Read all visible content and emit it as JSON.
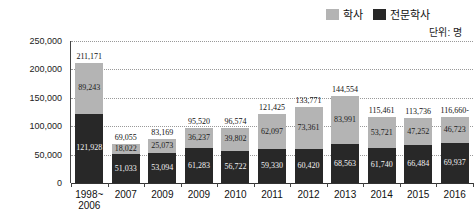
{
  "legend": {
    "items": [
      {
        "label": "학사",
        "color": "#b4b4b4"
      },
      {
        "label": "전문학사",
        "color": "#282828"
      }
    ]
  },
  "unit_label": "단위: 명",
  "chart_data": {
    "type": "bar",
    "stacked": true,
    "grid": true,
    "legend_position": "top-right",
    "ylim": [
      0,
      250000
    ],
    "yticks": [
      0,
      50000,
      100000,
      150000,
      200000,
      250000
    ],
    "ytick_labels": [
      "0",
      "50,000",
      "100,000",
      "150,000",
      "200,000",
      "250,000"
    ],
    "categories": [
      "1998~|2006",
      "2007",
      "2009",
      "2009",
      "2010",
      "2011",
      "2012",
      "2013",
      "2014",
      "2015",
      "2016"
    ],
    "series": [
      {
        "name": "전문학사",
        "color": "#282828",
        "label_color": "#f3f3f3",
        "values": [
          121928,
          51033,
          53094,
          61283,
          56722,
          59330,
          60420,
          68563,
          61740,
          66484,
          69937
        ],
        "labels": [
          "121,928",
          "51,033",
          "53,094",
          "61,283",
          "56,722",
          "59,330",
          "60,420",
          "68,563",
          "61,740",
          "66,484",
          "69,937"
        ]
      },
      {
        "name": "학사",
        "color": "#b4b4b4",
        "label_color": "#1c1c1c",
        "values": [
          89243,
          18022,
          25073,
          36237,
          39802,
          62097,
          73361,
          83991,
          53721,
          47252,
          46723
        ],
        "labels": [
          "89,243",
          "18,022",
          "25,073",
          "36,237",
          "39,802",
          "62,097",
          "73,361",
          "83,991",
          "53,721",
          "47,252",
          "46,723"
        ]
      }
    ],
    "totals": [
      211171,
      69055,
      83169,
      95520,
      96574,
      121425,
      133771,
      144554,
      115461,
      113736,
      116660
    ],
    "total_labels": [
      "211,171",
      "69,055",
      "83,169",
      "95,520",
      "96,574",
      "121,425",
      "133,771",
      "144,554",
      "115,461",
      "113,736",
      "116,660-"
    ]
  }
}
